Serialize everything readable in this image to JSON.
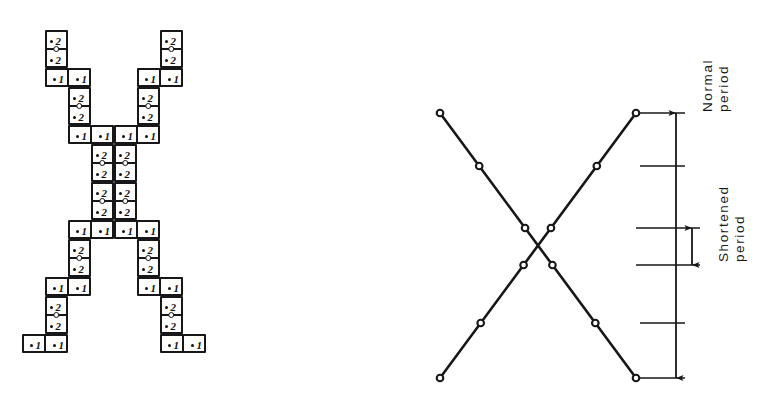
{
  "figure": {
    "kind": "technical-line-drawing",
    "panels": [
      "domino-tiling",
      "period-schedule"
    ]
  },
  "domino_tiling": {
    "pip_glyph": "•",
    "values": {
      "vertical": "2",
      "horizontal": "1"
    },
    "cell_width": 23,
    "cell_height": 19,
    "dominoes": [
      {
        "id": "d01",
        "orient": "vertical",
        "col": 1,
        "row": 0,
        "labels": [
          "2",
          "2"
        ]
      },
      {
        "id": "d02",
        "orient": "horizontal",
        "col": 1,
        "row": 2,
        "labels": [
          "1",
          "1"
        ]
      },
      {
        "id": "d03",
        "orient": "vertical",
        "col": 2,
        "row": 3,
        "labels": [
          "2",
          "2"
        ]
      },
      {
        "id": "d04",
        "orient": "horizontal",
        "col": 2,
        "row": 5,
        "labels": [
          "1",
          "1"
        ]
      },
      {
        "id": "d05",
        "orient": "vertical",
        "col": 3,
        "row": 6,
        "labels": [
          "2",
          "2"
        ]
      },
      {
        "id": "d06",
        "orient": "vertical",
        "col": 3,
        "row": 8,
        "labels": [
          "2",
          "2"
        ]
      },
      {
        "id": "d07",
        "orient": "horizontal",
        "col": 2,
        "row": 10,
        "labels": [
          "1",
          "1"
        ]
      },
      {
        "id": "d08",
        "orient": "vertical",
        "col": 2,
        "row": 11,
        "labels": [
          "2",
          "2"
        ]
      },
      {
        "id": "d09",
        "orient": "horizontal",
        "col": 1,
        "row": 13,
        "labels": [
          "1",
          "1"
        ]
      },
      {
        "id": "d10",
        "orient": "vertical",
        "col": 1,
        "row": 14,
        "labels": [
          "2",
          "2"
        ]
      },
      {
        "id": "d11",
        "orient": "horizontal",
        "col": 0,
        "row": 16,
        "labels": [
          "1",
          "1"
        ]
      },
      {
        "id": "d12",
        "orient": "vertical",
        "col": 6,
        "row": 0,
        "labels": [
          "2",
          "2"
        ]
      },
      {
        "id": "d13",
        "orient": "horizontal",
        "col": 5,
        "row": 2,
        "labels": [
          "1",
          "1"
        ]
      },
      {
        "id": "d14",
        "orient": "vertical",
        "col": 5,
        "row": 3,
        "labels": [
          "2",
          "2"
        ]
      },
      {
        "id": "d15",
        "orient": "horizontal",
        "col": 4,
        "row": 5,
        "labels": [
          "1",
          "1"
        ]
      },
      {
        "id": "d16",
        "orient": "vertical",
        "col": 4,
        "row": 6,
        "labels": [
          "2",
          "2"
        ]
      },
      {
        "id": "d17",
        "orient": "vertical",
        "col": 4,
        "row": 8,
        "labels": [
          "2",
          "2"
        ]
      },
      {
        "id": "d18",
        "orient": "horizontal",
        "col": 4,
        "row": 10,
        "labels": [
          "1",
          "1"
        ]
      },
      {
        "id": "d19",
        "orient": "vertical",
        "col": 5,
        "row": 11,
        "labels": [
          "2",
          "2"
        ]
      },
      {
        "id": "d20",
        "orient": "horizontal",
        "col": 5,
        "row": 13,
        "labels": [
          "1",
          "1"
        ]
      },
      {
        "id": "d21",
        "orient": "vertical",
        "col": 6,
        "row": 14,
        "labels": [
          "2",
          "2"
        ]
      },
      {
        "id": "d22",
        "orient": "horizontal",
        "col": 6,
        "row": 16,
        "labels": [
          "1",
          "1"
        ]
      }
    ]
  },
  "period_schedule": {
    "labels": {
      "normal": {
        "line1": "Normal",
        "line2": "period"
      },
      "shortened": {
        "line1": "Shortened",
        "line2": "period"
      }
    },
    "node_levels": [
      113,
      166,
      228,
      265,
      323,
      378
    ],
    "descending_line": {
      "from": [
        40,
        113
      ],
      "to": [
        236,
        378
      ]
    },
    "ascending_line": {
      "from": [
        40,
        378
      ],
      "to": [
        236,
        113
      ]
    },
    "nodes_per_line": 6,
    "dimension_lines": [
      {
        "name": "normal-period",
        "x": 276,
        "from_y": 113,
        "to_y": 378
      },
      {
        "name": "shortened-period",
        "x": 292,
        "from_y": 228,
        "to_y": 265
      }
    ],
    "extension_lines": [
      {
        "y": 113,
        "x1": 240,
        "x2": 285
      },
      {
        "y": 166,
        "x1": 240,
        "x2": 285
      },
      {
        "y": 228,
        "x1": 236,
        "x2": 300
      },
      {
        "y": 265,
        "x1": 236,
        "x2": 300
      },
      {
        "y": 323,
        "x1": 240,
        "x2": 285
      },
      {
        "y": 378,
        "x1": 240,
        "x2": 285
      }
    ]
  },
  "colors": {
    "ink": "#17171a",
    "paper": "#ffffff",
    "tile_fill": "#fdfdfb"
  }
}
